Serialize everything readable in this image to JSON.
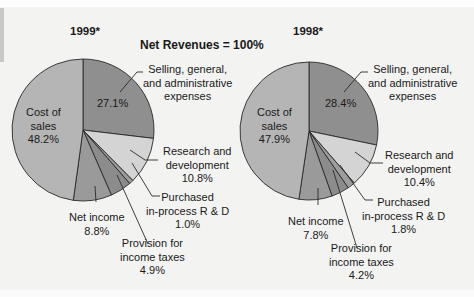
{
  "chart_data": [
    {
      "type": "pie",
      "title": "1999*",
      "subtitle": "Net Revenues = 100%",
      "start_angle": "12 o'clock, clockwise",
      "categories": [
        "Selling, general, and administrative expenses",
        "Research and development",
        "Purchased in-process R & D",
        "Provision for income taxes",
        "Net income",
        "Cost of sales"
      ],
      "values": [
        27.1,
        10.8,
        1.0,
        4.9,
        8.8,
        48.2
      ],
      "colors": [
        "#8f8f8f",
        "#d4d4d4",
        "#9d9d9d",
        "#8c8c8c",
        "#9a9a9a",
        "#b5b5b5"
      ]
    },
    {
      "type": "pie",
      "title": "1998*",
      "subtitle": "Net Revenues = 100%",
      "start_angle": "12 o'clock, clockwise",
      "categories": [
        "Selling, general, and administrative expenses",
        "Research and development",
        "Purchased in-process R & D",
        "Provision for income taxes",
        "Net income",
        "Cost of sales"
      ],
      "values": [
        28.4,
        10.4,
        1.8,
        4.2,
        7.8,
        47.9
      ],
      "colors": [
        "#8f8f8f",
        "#d4d4d4",
        "#9d9d9d",
        "#8c8c8c",
        "#9a9a9a",
        "#b5b5b5"
      ]
    }
  ],
  "header": {
    "title": "Net Revenues = 100%",
    "year_left": "1999*",
    "year_right": "1998*"
  },
  "left": {
    "sga": {
      "l1": "Selling, general,",
      "l2": "and administrative",
      "l3": "expenses",
      "pct": "27.1%"
    },
    "cos": {
      "l1": "Cost of",
      "l2": "sales",
      "pct": "48.2%"
    },
    "rd": {
      "l1": "Research and",
      "l2": "development",
      "pct": "10.8%"
    },
    "prd": {
      "l1": "Purchased",
      "l2": "in-process R & D",
      "pct": "1.0%"
    },
    "tax": {
      "l1": "Provision for",
      "l2": "income taxes",
      "pct": "4.9%"
    },
    "ni": {
      "l1": "Net income",
      "pct": "8.8%"
    }
  },
  "right": {
    "sga": {
      "l1": "Selling, general,",
      "l2": "and administrative",
      "l3": "expenses",
      "pct": "28.4%"
    },
    "cos": {
      "l1": "Cost of",
      "l2": "sales",
      "pct": "47.9%"
    },
    "rd": {
      "l1": "Research and",
      "l2": "development",
      "pct": "10.4%"
    },
    "prd": {
      "l1": "Purchased",
      "l2": "in-process R & D",
      "pct": "1.8%"
    },
    "tax": {
      "l1": "Provision for",
      "l2": "income taxes",
      "pct": "4.2%"
    },
    "ni": {
      "l1": "Net income",
      "pct": "7.8%"
    }
  }
}
